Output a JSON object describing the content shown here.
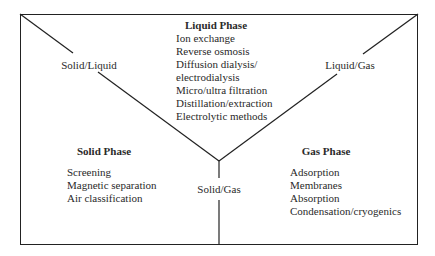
{
  "diagram": {
    "line_color": "#222222",
    "background": "#ffffff",
    "labels": {
      "solid_liquid": "Solid/Liquid",
      "liquid_gas": "Liquid/Gas",
      "solid_gas": "Solid/Gas"
    },
    "liquid_phase": {
      "title": "Liquid Phase",
      "items": [
        "Ion exchange",
        "Reverse osmosis",
        "Diffusion dialysis/",
        "electrodialysis",
        "Micro/ultra filtration",
        "Distillation/extraction",
        "Electrolytic methods"
      ]
    },
    "solid_phase": {
      "title": "Solid Phase",
      "items": [
        "Screening",
        "Magnetic separation",
        "Air classification"
      ]
    },
    "gas_phase": {
      "title": "Gas Phase",
      "items": [
        "Adsorption",
        "Membranes",
        "Absorption",
        "Condensation/cryogenics"
      ]
    }
  }
}
